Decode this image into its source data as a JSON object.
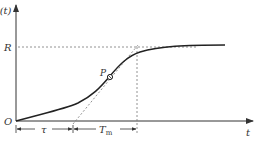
{
  "diagram": {
    "type": "step-response-tangent-method",
    "y_axis_label": "y(t)",
    "x_axis_label": "t",
    "origin_label": "O",
    "steady_state_label": "R",
    "inflection_point_label": "P",
    "delay_label": "τ",
    "time_constant_label": "T",
    "time_constant_subscript": "m",
    "colors": {
      "curve": "#222222",
      "axes": "#333333",
      "dashed": "#777777",
      "text": "#333333"
    }
  }
}
